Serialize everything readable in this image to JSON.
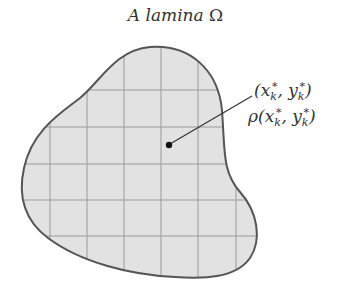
{
  "title": {
    "prefix": "A lamina",
    "symbol": "Ω"
  },
  "point_label": {
    "x": "x",
    "y": "y",
    "sub": "k",
    "star": "*",
    "density": "ρ"
  },
  "colors": {
    "fill": "#e2e2e2",
    "outline": "#555555",
    "grid": "#9a9a9a",
    "text": "#333333"
  }
}
